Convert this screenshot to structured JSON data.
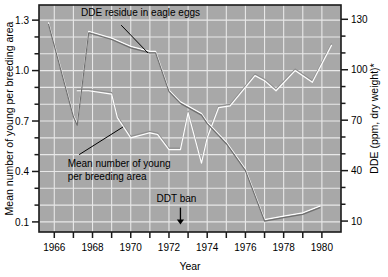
{
  "chart_data": {
    "type": "line",
    "title": "",
    "xlabel": "Year",
    "ylabel": "Mean number of young per breeding area",
    "y2label": "DDE (ppm, dry weight)*",
    "xlim": [
      1965.2,
      1981.0
    ],
    "ylim": [
      0.04,
      1.39
    ],
    "y2lim": [
      3.5,
      138.5
    ],
    "grid": true,
    "legend_position": "none",
    "x_ticks": [
      1966,
      1967,
      1968,
      1969,
      1970,
      1971,
      1972,
      1973,
      1974,
      1975,
      1976,
      1977,
      1978,
      1979,
      1980
    ],
    "x_tick_labels": [
      "1966",
      "",
      "1968",
      "",
      "1970",
      "",
      "1972",
      "",
      "1974",
      "",
      "1976",
      "",
      "1978",
      "",
      "1980"
    ],
    "y_ticks": [
      0.1,
      0.2,
      0.3,
      0.4,
      0.5,
      0.6,
      0.7,
      0.8,
      0.9,
      1.0,
      1.1,
      1.2,
      1.3
    ],
    "y_tick_labels": [
      "0.1",
      "",
      "",
      "0.4",
      "",
      "",
      "0.7",
      "",
      "",
      "1.0",
      "",
      "",
      "1.3"
    ],
    "y2_ticks": [
      10,
      20,
      30,
      40,
      50,
      60,
      70,
      80,
      90,
      100,
      110,
      120,
      130
    ],
    "y2_tick_labels": [
      "10",
      "",
      "",
      "40",
      "",
      "",
      "70",
      "",
      "",
      "100",
      "",
      "",
      "130"
    ],
    "series": [
      {
        "name": "DDE residue in eagle eggs",
        "axis": "right",
        "units": "ppm, dry weight",
        "x": [
          1965.7,
          1967.0,
          1967.2,
          1967.8,
          1969.0,
          1970.0,
          1971.0,
          1971.3,
          1972.0,
          1972.6,
          1973.7,
          1974.0,
          1975.0,
          1976.0,
          1977.0,
          1978.0,
          1979.0,
          1979.9
        ],
        "values": [
          127,
          72,
          67,
          122,
          118,
          113,
          110,
          110,
          87,
          80,
          73,
          68,
          56,
          40,
          10,
          12,
          14,
          18
        ]
      },
      {
        "name": "Mean number of young per breeding area",
        "axis": "left",
        "units": "young per breeding area",
        "x": [
          1967.2,
          1967.8,
          1969.0,
          1969.3,
          1970.0,
          1971.0,
          1971.4,
          1972.0,
          1972.6,
          1973.0,
          1973.7,
          1974.0,
          1974.6,
          1975.2,
          1976.5,
          1977.0,
          1977.6,
          1978.6,
          1979.5,
          1980.5
        ],
        "values": [
          0.88,
          0.88,
          0.86,
          0.72,
          0.6,
          0.63,
          0.62,
          0.53,
          0.53,
          0.75,
          0.45,
          0.6,
          0.78,
          0.79,
          0.97,
          0.94,
          0.88,
          1.0,
          0.93,
          1.15
        ]
      }
    ],
    "annotations": [
      {
        "name": "dde-residue-label",
        "text": "DDE residue in eagle eggs",
        "text_x": 1967.4,
        "text_y": 1.325,
        "leader_from_x": 1969.5,
        "leader_from_y": 1.27,
        "leader_to_x": 1970.9,
        "leader_to_y": 1.108
      },
      {
        "name": "mean-young-label",
        "text_line1": "Mean number of young",
        "text_line2": "per breeding area",
        "text_x": 1966.7,
        "text_y": 0.425,
        "leader_from_x": 1967.3,
        "leader_from_y": 0.5,
        "leader_to_x": 1969.6,
        "leader_to_y": 0.665
      },
      {
        "name": "ddt-ban-marker",
        "text": "DDT ban",
        "text_x": 1971.35,
        "text_y": 0.22,
        "arrow_x": 1972.6,
        "arrow_top_y": 0.185,
        "arrow_bottom_y": 0.085
      }
    ]
  },
  "colors": {
    "plot_background": "#a8a8a8",
    "gridline": "#e8e8e8",
    "line_dde": "#7a7a7a",
    "line_young": "#d9d9d9",
    "axis": "#1a1a1a",
    "text": "#000000",
    "page_background": "#ffffff"
  }
}
